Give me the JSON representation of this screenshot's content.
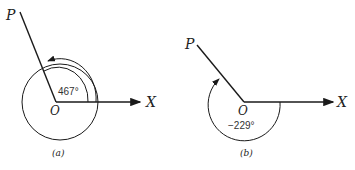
{
  "diagram_a": {
    "point_p": "P",
    "origin": "O",
    "axis": "X",
    "angle": "467°",
    "caption": "(a)"
  },
  "diagram_b": {
    "point_p": "P",
    "origin": "O",
    "axis": "X",
    "angle": "−229°",
    "caption": "(b)"
  },
  "colors": {
    "stroke": "#1a1a1a"
  }
}
